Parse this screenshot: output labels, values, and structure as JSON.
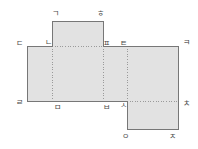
{
  "figure": {
    "name": "cuboid-net-diagram",
    "background_color": "#ffffff",
    "face_fill_color": "#e2e2e2",
    "edge_color": "#777777",
    "fold_line_color": "#9a9a9a",
    "label_color": "#4a4a4a",
    "width": 198,
    "height": 149
  },
  "vertices": [
    {
      "id": "v-giyeok",
      "label": "ㄱ",
      "x": 55,
      "y": 14
    },
    {
      "id": "v-hieut",
      "label": "ㅎ",
      "x": 100,
      "y": 14
    },
    {
      "id": "v-digeut",
      "label": "ㄷ",
      "x": 19,
      "y": 44
    },
    {
      "id": "v-nieun",
      "label": "ㄴ",
      "x": 48,
      "y": 43
    },
    {
      "id": "v-pieup2",
      "label": "ㅍ",
      "x": 106,
      "y": 44
    },
    {
      "id": "v-tieut",
      "label": "ㅌ",
      "x": 123,
      "y": 44
    },
    {
      "id": "v-kieuk",
      "label": "ㅋ",
      "x": 186,
      "y": 43
    },
    {
      "id": "v-rieul",
      "label": "ㄹ",
      "x": 19,
      "y": 103
    },
    {
      "id": "v-mieum",
      "label": "ㅁ",
      "x": 57,
      "y": 108
    },
    {
      "id": "v-bieup",
      "label": "ㅂ",
      "x": 106,
      "y": 108
    },
    {
      "id": "v-siot",
      "label": "ㅅ",
      "x": 123,
      "y": 106
    },
    {
      "id": "v-chieut",
      "label": "ㅊ",
      "x": 186,
      "y": 104
    },
    {
      "id": "v-ieung",
      "label": "ㅇ",
      "x": 125,
      "y": 137
    },
    {
      "id": "v-jieut",
      "label": "ㅈ",
      "x": 172,
      "y": 137
    }
  ],
  "faces": [
    {
      "id": "face-top-flap",
      "x": 52,
      "y": 21,
      "w": 51,
      "h": 25
    },
    {
      "id": "face-left",
      "x": 27,
      "y": 46,
      "w": 25,
      "h": 55
    },
    {
      "id": "face-center-left",
      "x": 52,
      "y": 46,
      "w": 51,
      "h": 55
    },
    {
      "id": "face-center-right",
      "x": 103,
      "y": 46,
      "w": 24,
      "h": 55
    },
    {
      "id": "face-right",
      "x": 127,
      "y": 46,
      "w": 51,
      "h": 55
    },
    {
      "id": "face-bottom-flap",
      "x": 127,
      "y": 101,
      "w": 51,
      "h": 28
    }
  ],
  "outline": "M52,21 L103,21 L103,46 L178,46 L178,101 L178,129 L127,129 L127,101 L27,101 L27,46 L52,46 Z",
  "fold_lines": [
    {
      "id": "fold-vertical-nieun-mieum",
      "x1": 52,
      "y1": 46,
      "x2": 52,
      "y2": 101
    },
    {
      "id": "fold-vertical-pieup-bieup",
      "x1": 103,
      "y1": 46,
      "x2": 103,
      "y2": 101
    },
    {
      "id": "fold-vertical-tieut-siot",
      "x1": 127,
      "y1": 46,
      "x2": 127,
      "y2": 101
    },
    {
      "id": "fold-horizontal-nieun-pieup",
      "x1": 52,
      "y1": 46,
      "x2": 103,
      "y2": 46
    },
    {
      "id": "fold-horizontal-siot-chieut",
      "x1": 127,
      "y1": 101,
      "x2": 178,
      "y2": 101
    }
  ]
}
